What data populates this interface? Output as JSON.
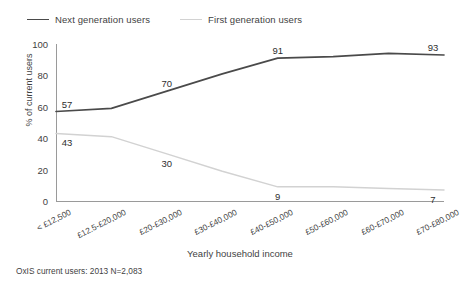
{
  "title_fragment": "",
  "legend": {
    "items": [
      {
        "label": "Next generation users",
        "color": "#4a4a4a"
      },
      {
        "label": "First generation users",
        "color": "#d2d2d2"
      }
    ]
  },
  "axes": {
    "ylabel": "% of current users",
    "xlabel": "Yearly household income",
    "yticks": [
      "0",
      "20",
      "40",
      "60",
      "80",
      "100"
    ]
  },
  "footnote": "OxIS current users: 2013 N=2,083",
  "chart_data": {
    "type": "line",
    "title": "",
    "xlabel": "Yearly household income",
    "ylabel": "% of current users",
    "ylim": [
      0,
      100
    ],
    "yticks": [
      0,
      20,
      40,
      60,
      80,
      100
    ],
    "grid": false,
    "legend_position": "top-left",
    "categories": [
      "< £12,500",
      "£12.5-£20,000",
      "£20-£30,000",
      "£30-£40,000",
      "£40-£50,000",
      "£50-£60,000",
      "£60-£70,000",
      "£70-£80,000"
    ],
    "series": [
      {
        "name": "Next generation users",
        "color": "#4a4a4a",
        "values": [
          57,
          59,
          70,
          81,
          91,
          92,
          94,
          93
        ],
        "point_labels": [
          {
            "index": 0,
            "text": "57"
          },
          {
            "index": 2,
            "text": "70"
          },
          {
            "index": 4,
            "text": "91"
          },
          {
            "index": 7,
            "text": "93"
          }
        ]
      },
      {
        "name": "First generation users",
        "color": "#d2d2d2",
        "values": [
          43,
          41,
          30,
          19,
          9,
          9,
          8,
          7
        ],
        "point_labels": [
          {
            "index": 0,
            "text": "43"
          },
          {
            "index": 2,
            "text": "30"
          },
          {
            "index": 4,
            "text": "9"
          },
          {
            "index": 7,
            "text": "7"
          }
        ]
      }
    ]
  }
}
